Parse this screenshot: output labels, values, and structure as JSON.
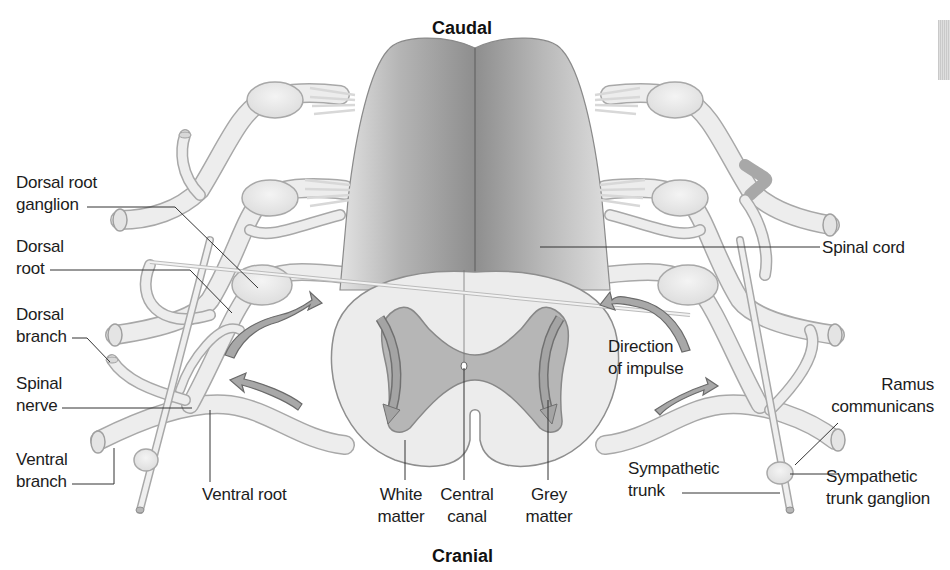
{
  "diagram": {
    "orientation": {
      "top": "Caudal",
      "bottom": "Cranial"
    },
    "labels_left": [
      {
        "id": "dorsal-root-ganglion",
        "text": "Dorsal root\nganglion"
      },
      {
        "id": "dorsal-root",
        "text": "Dorsal\nroot"
      },
      {
        "id": "dorsal-branch",
        "text": "Dorsal\nbranch"
      },
      {
        "id": "spinal-nerve",
        "text": "Spinal\nnerve"
      },
      {
        "id": "ventral-branch",
        "text": "Ventral\nbranch"
      }
    ],
    "labels_bottom": [
      {
        "id": "ventral-root",
        "text": "Ventral root"
      },
      {
        "id": "white-matter",
        "text": "White\nmatter"
      },
      {
        "id": "central-canal",
        "text": "Central\ncanal"
      },
      {
        "id": "grey-matter",
        "text": "Grey\nmatter"
      }
    ],
    "labels_right": [
      {
        "id": "spinal-cord",
        "text": "Spinal cord"
      },
      {
        "id": "direction-of-impulse",
        "text": "Direction\nof impulse"
      },
      {
        "id": "ramus-communicans",
        "text": "Ramus\ncommunicans"
      },
      {
        "id": "sympathetic-trunk",
        "text": "Sympathetic\ntrunk"
      },
      {
        "id": "sympathetic-trunk-ganglion",
        "text": "Sympathetic\ntrunk ganglion"
      }
    ],
    "colors": {
      "background": "#ffffff",
      "cord_dark": "#9a9a9a",
      "cord_light": "#d4d4d4",
      "nerve_fill": "#ececec",
      "nerve_stroke": "#a8a8a8",
      "grey_matter": "#b4b4b4",
      "white_matter": "#ebebeb",
      "arrow_fill": "#a6a6a6",
      "label_text": "#1c1c1c",
      "leader_line": "#333333"
    }
  }
}
